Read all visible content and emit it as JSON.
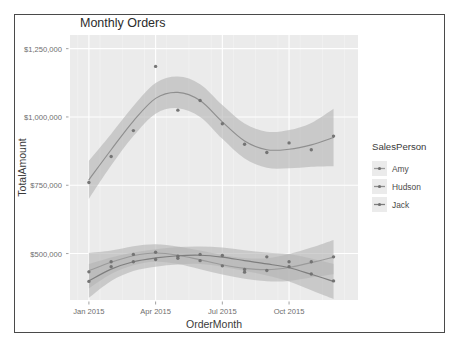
{
  "chart_data": {
    "type": "line",
    "title": "Monthly Orders",
    "xlabel": "OrderMonth",
    "ylabel": "TotalAmount",
    "grid": true,
    "legend_position": "right",
    "legend_title": "SalesPerson",
    "xtick_labels": [
      "Jan 2015",
      "Apr 2015",
      "Jul 2015",
      "Oct 2015"
    ],
    "xtick_values": [
      0,
      3,
      6,
      9
    ],
    "ytick_labels": [
      "$500,000",
      "$750,000",
      "$1,000,000",
      "$1,250,000"
    ],
    "ytick_values": [
      500000,
      750000,
      1000000,
      1250000
    ],
    "xlim": [
      -0.85,
      12.1
    ],
    "ylim": [
      330000,
      1300000
    ],
    "smoothing": "loess with confidence ribbon",
    "series": [
      {
        "name": "Amy",
        "color": "#9a9a9a",
        "x": [
          0,
          1,
          2,
          3,
          4,
          5,
          6,
          7,
          8,
          9,
          10,
          11
        ],
        "values": [
          433000,
          470000,
          497000,
          505000,
          483000,
          474000,
          455000,
          442000,
          438000,
          452000,
          470000,
          488000
        ],
        "fit": [
          437000,
          468000,
          492000,
          502000,
          494000,
          477000,
          459000,
          446000,
          441000,
          449000,
          467000,
          487000
        ],
        "ribbon_low": [
          372000,
          425000,
          457000,
          470000,
          462000,
          443000,
          423000,
          408000,
          399000,
          400000,
          412000,
          424000
        ],
        "ribbon_high": [
          502000,
          511000,
          527000,
          534000,
          526000,
          511000,
          495000,
          484000,
          483000,
          498000,
          522000,
          550000
        ]
      },
      {
        "name": "Hudson",
        "color": "#8f8f8f",
        "x": [
          0,
          1,
          2,
          3,
          4,
          5,
          6,
          7,
          8,
          9,
          10,
          11
        ],
        "values": [
          760000,
          855000,
          950000,
          1185000,
          1025000,
          1060000,
          975000,
          900000,
          870000,
          905000,
          880000,
          930000
        ],
        "fit": [
          770000,
          880000,
          985000,
          1068000,
          1090000,
          1060000,
          982000,
          912000,
          880000,
          882000,
          898000,
          925000
        ],
        "ribbon_low": [
          700000,
          822000,
          930000,
          1012000,
          1032000,
          1000000,
          920000,
          848000,
          814000,
          812000,
          818000,
          820000
        ],
        "ribbon_high": [
          840000,
          938000,
          1040000,
          1124000,
          1148000,
          1120000,
          1044000,
          976000,
          946000,
          952000,
          978000,
          1030000
        ]
      },
      {
        "name": "Jack",
        "color": "#7e7e7e",
        "x": [
          0,
          1,
          2,
          3,
          4,
          5,
          6,
          7,
          8,
          9,
          10,
          11
        ],
        "values": [
          398000,
          452000,
          470000,
          478000,
          490000,
          497000,
          493000,
          432000,
          488000,
          470000,
          425000,
          400000
        ],
        "fit": [
          400000,
          443000,
          470000,
          484000,
          492000,
          494000,
          487000,
          474000,
          462000,
          448000,
          424000,
          398000
        ],
        "ribbon_low": [
          338000,
          400000,
          436000,
          452000,
          460000,
          462000,
          452000,
          436000,
          420000,
          398000,
          366000,
          334000
        ],
        "ribbon_high": [
          462000,
          486000,
          504000,
          516000,
          524000,
          526000,
          522000,
          512000,
          504000,
          498000,
          482000,
          462000
        ]
      }
    ]
  },
  "legend": {
    "title": "SalesPerson",
    "items": [
      {
        "label": "Amy",
        "color": "#9a9a9a"
      },
      {
        "label": "Hudson",
        "color": "#8f8f8f"
      },
      {
        "label": "Jack",
        "color": "#7e7e7e"
      }
    ]
  },
  "panel": {
    "background": "#ebebeb",
    "gridline_color": "#ffffff",
    "ribbon_color": "#b5b5b5"
  }
}
